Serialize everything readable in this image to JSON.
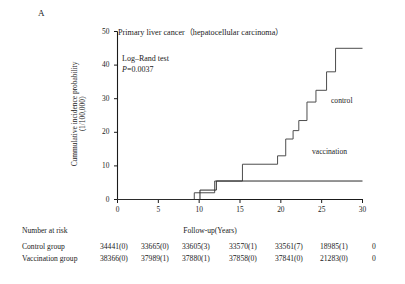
{
  "panel": {
    "letter": "A"
  },
  "chart_data": {
    "type": "line",
    "subtype": "kaplan-meier-cumulative-incidence-step",
    "title": "Primary liver cancer（hepatocellular carcinoma）",
    "xlabel": "Follow-up(Years)",
    "ylabel": "Cummulative incidence probability（1/100,000）",
    "ylabel_line1": "Cummulative incidence probability",
    "ylabel_line2": "（1/100,000）",
    "xlim": [
      0,
      30
    ],
    "ylim": [
      0,
      50
    ],
    "xticks": [
      0,
      5,
      10,
      15,
      20,
      25,
      30
    ],
    "xtick_labels": [
      "0",
      "5",
      "10",
      "15",
      "20",
      "25",
      "30"
    ],
    "yticks": [
      0,
      10,
      20,
      30,
      40,
      50
    ],
    "ytick_labels": [
      "0",
      "10",
      "20",
      "30",
      "40",
      "50"
    ],
    "grid": false,
    "legend_position": "inline-annotations",
    "annotations": [
      {
        "name": "log-rank-test",
        "text": "Log–Rand test"
      },
      {
        "name": "p-value",
        "text": "P=0.0037",
        "italic_prefix": "P",
        "value": "=0.0037"
      },
      {
        "name": "control-curve-label",
        "text": "control"
      },
      {
        "name": "vaccination-curve-label",
        "text": "vaccination"
      }
    ],
    "series": [
      {
        "name": "control",
        "label": "control",
        "color": "#4d4d4d",
        "points": [
          [
            0,
            0
          ],
          [
            9.4,
            0
          ],
          [
            9.4,
            2.0
          ],
          [
            11.9,
            2.0
          ],
          [
            11.9,
            5.5
          ],
          [
            15.3,
            5.5
          ],
          [
            15.3,
            10.5
          ],
          [
            19.6,
            10.5
          ],
          [
            19.6,
            13.0
          ],
          [
            20.6,
            13.0
          ],
          [
            20.6,
            18.0
          ],
          [
            21.5,
            18.0
          ],
          [
            21.5,
            20.5
          ],
          [
            22.2,
            20.5
          ],
          [
            22.2,
            23.5
          ],
          [
            23.2,
            23.5
          ],
          [
            23.2,
            29.0
          ],
          [
            24.3,
            29.0
          ],
          [
            24.3,
            32.5
          ],
          [
            25.6,
            32.5
          ],
          [
            25.6,
            38.0
          ],
          [
            26.7,
            38.0
          ],
          [
            26.7,
            45.0
          ],
          [
            30,
            45.0
          ]
        ]
      },
      {
        "name": "vaccination",
        "label": "vaccination",
        "color": "#2b2b2b",
        "points": [
          [
            0,
            0
          ],
          [
            10.1,
            0
          ],
          [
            10.1,
            2.8
          ],
          [
            12.1,
            2.8
          ],
          [
            12.1,
            5.5
          ],
          [
            30,
            5.5
          ]
        ]
      }
    ]
  },
  "risk_table": {
    "title": "Number at risk",
    "axis_caption": "Follow-up(Years)",
    "time_points": [
      0,
      5,
      10,
      15,
      20,
      25,
      30
    ],
    "rows": [
      {
        "name": "control-group",
        "label": "Control group",
        "values": [
          "34441(0)",
          "33665(0)",
          "33605(3)",
          "33570(1)",
          "33561(7)",
          "18985(1)",
          "0"
        ]
      },
      {
        "name": "vaccination-group",
        "label": "Vaccination group",
        "values": [
          "38366(0)",
          "37989(1)",
          "37880(1)",
          "37858(0)",
          "37841(0)",
          "21283(0)",
          "0"
        ]
      }
    ]
  },
  "colors": {
    "axis": "#1a1a1a",
    "control_line": "#4d4d4d",
    "vaccination_line": "#2b2b2b",
    "text": "#1a1a1a",
    "background": "#ffffff"
  }
}
